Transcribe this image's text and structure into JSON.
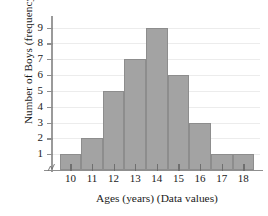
{
  "chart_data": {
    "type": "bar",
    "title": "",
    "subtitle": "",
    "xlabel": "Ages (years) (Data values)",
    "ylabel": "Number of Boys (frequency)",
    "categories": [
      "10",
      "11",
      "12",
      "13",
      "14",
      "15",
      "16",
      "17",
      "18"
    ],
    "values": [
      1,
      2,
      5,
      7,
      9,
      6,
      3,
      1,
      1
    ],
    "ytick_labels": [
      "1",
      "2",
      "3",
      "4",
      "5",
      "6",
      "7",
      "8",
      "9"
    ],
    "ytick_values": [
      1,
      2,
      3,
      4,
      5,
      6,
      7,
      8,
      9
    ],
    "ylim": [
      0,
      9.6
    ],
    "xlim": [
      9.5,
      18.5
    ],
    "grid": true,
    "grid_axis": "y",
    "legend": false,
    "legend_position": "none",
    "bar_color": "#a3a3a3",
    "bar_edge_color": "#8d8d8d",
    "grid_color": "#ececec",
    "axis_color": "#8f8f8f",
    "text_color": "#1a1a1a",
    "background_color": "#ffffff",
    "annotations": [
      "axis-break"
    ]
  }
}
